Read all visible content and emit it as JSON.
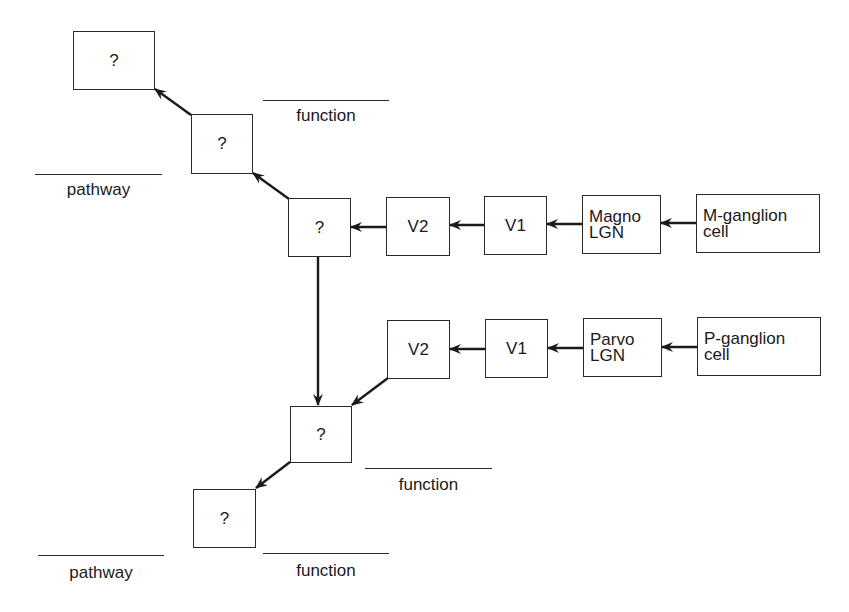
{
  "diagram": {
    "type": "flowchart",
    "nodes": {
      "q1": {
        "label": "?"
      },
      "q2": {
        "label": "?"
      },
      "q3": {
        "label": "?"
      },
      "q4": {
        "label": "?"
      },
      "q5": {
        "label": "?"
      },
      "v2_magno": {
        "label": "V2"
      },
      "v1_magno": {
        "label": "V1"
      },
      "magno_lgn": {
        "label": "Magno\nLGN"
      },
      "m_ganglion": {
        "label": "M-ganglion\ncell"
      },
      "v2_parvo": {
        "label": "V2"
      },
      "v1_parvo": {
        "label": "V1"
      },
      "parvo_lgn": {
        "label": "Parvo\nLGN"
      },
      "p_ganglion": {
        "label": "P-ganglion\ncell"
      }
    },
    "edges": [
      {
        "from": "m_ganglion",
        "to": "magno_lgn"
      },
      {
        "from": "magno_lgn",
        "to": "v1_magno"
      },
      {
        "from": "v1_magno",
        "to": "v2_magno"
      },
      {
        "from": "v2_magno",
        "to": "q3"
      },
      {
        "from": "q3",
        "to": "q2"
      },
      {
        "from": "q2",
        "to": "q1"
      },
      {
        "from": "q3",
        "to": "q4"
      },
      {
        "from": "p_ganglion",
        "to": "parvo_lgn"
      },
      {
        "from": "parvo_lgn",
        "to": "v1_parvo"
      },
      {
        "from": "v1_parvo",
        "to": "v2_parvo"
      },
      {
        "from": "v2_parvo",
        "to": "q4"
      },
      {
        "from": "q4",
        "to": "q5"
      }
    ],
    "blanks": {
      "function_top": "function",
      "pathway_top": "pathway",
      "function_mid": "function",
      "pathway_bottom": "pathway",
      "function_bottom": "function"
    }
  }
}
